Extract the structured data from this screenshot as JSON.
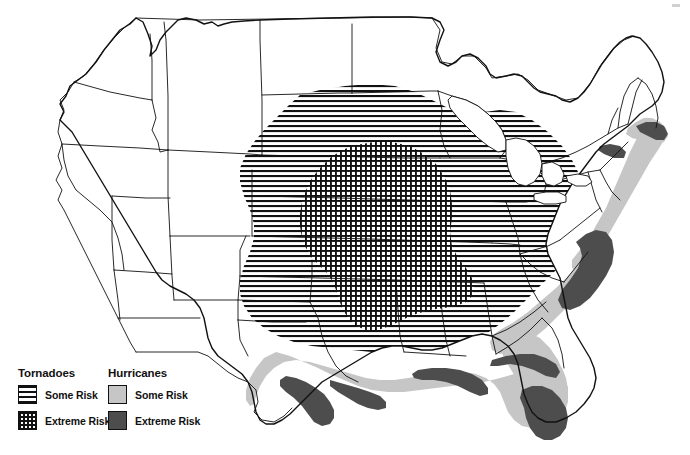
{
  "figure": {
    "kind": "thematic-map",
    "background_color": "#ffffff",
    "outline_color": "#111111"
  },
  "legend": {
    "tornadoes": {
      "title": "Tornadoes",
      "items": [
        {
          "label": "Some Risk",
          "pattern": "horizontal-lines",
          "swatch_color": "#111111"
        },
        {
          "label": "Extreme Risk",
          "pattern": "cross-hatch-grid",
          "swatch_color": "#111111"
        }
      ]
    },
    "hurricanes": {
      "title": "Hurricanes",
      "items": [
        {
          "label": "Some Risk",
          "pattern": "solid-fill",
          "swatch_color": "#c6c6c6"
        },
        {
          "label": "Extreme Risk",
          "pattern": "solid-fill",
          "swatch_color": "#4d4d4d"
        }
      ]
    }
  },
  "map": {
    "regions": [
      {
        "name": "tornado-some-risk",
        "description": "Broad horizontally hatched band across the Great Plains, Midwest and Southeast",
        "pattern": "horizontal-lines"
      },
      {
        "name": "tornado-extreme-risk",
        "description": "Dense cross-hatched core over Kansas, Oklahoma, Missouri and northern Texas",
        "pattern": "cross-hatch-grid"
      },
      {
        "name": "hurricane-some-risk",
        "description": "Light gray coastal band along the Gulf Coast, Florida and the Atlantic seaboard to New England",
        "fill": "#c6c6c6"
      },
      {
        "name": "hurricane-extreme-risk",
        "description": "Dark gray immediate shoreline of the Gulf Coast, south Florida, the Carolinas and Cape Cod",
        "fill": "#4d4d4d"
      }
    ]
  }
}
